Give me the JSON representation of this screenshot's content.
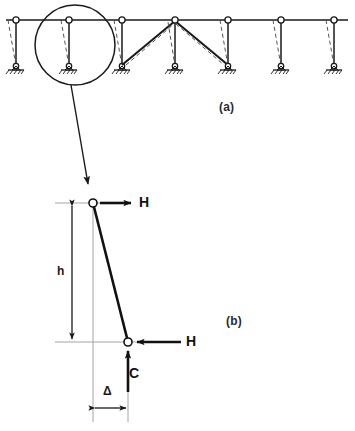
{
  "figure": {
    "background_color": "#ffffff",
    "line_color": "#1a1a1a",
    "dashed_color": "#4d4d4d"
  },
  "panels": [
    {
      "id": "a",
      "caption": "(a)",
      "description": "Pin-jointed multi-bay frame with leaning columns, deflected shapes dashed, one braced bay",
      "column_count": 7,
      "column_x": [
        16,
        69,
        122,
        175,
        228,
        281,
        334
      ],
      "beam_y": 20,
      "base_y": 68,
      "sway_offset": -8,
      "detail_circle": {
        "cx": 75,
        "cy": 45,
        "r": 40
      },
      "braced_bay": {
        "from_x": 122,
        "to_x": 228,
        "apex_x": 175
      }
    },
    {
      "id": "b",
      "caption": "(b)",
      "description": "Enlarged free-body of one leaning column of height h displaced by delta",
      "top_node": {
        "x": 93,
        "y": 203
      },
      "bottom_node": {
        "x": 128,
        "y": 342
      }
    }
  ],
  "labels": {
    "caption_a": "(a)",
    "caption_b": "(b)",
    "force_h_top": "H",
    "force_h_bottom": "H",
    "force_c": "C",
    "dimension_height": "h",
    "dimension_delta": "Δ"
  },
  "annotations": {
    "leader_arrow": {
      "from": {
        "x": 71,
        "y": 85
      },
      "to": {
        "x": 88,
        "y": 186
      }
    },
    "h_top_arrow": {
      "x1": 100,
      "y1": 203,
      "x2": 131,
      "y2": 203,
      "direction": "right"
    },
    "h_bottom_arrow": {
      "x1": 180,
      "y1": 342,
      "x2": 136,
      "y2": 342,
      "direction": "left"
    },
    "c_arrow": {
      "x1": 128,
      "y1": 392,
      "x2": 128,
      "y2": 350,
      "direction": "up"
    },
    "h_dimension": {
      "x": 72,
      "y1": 203,
      "y2": 342,
      "direction": "both"
    },
    "delta_dimension": {
      "y": 408,
      "x1": 93,
      "x2": 128,
      "direction": "both"
    }
  }
}
